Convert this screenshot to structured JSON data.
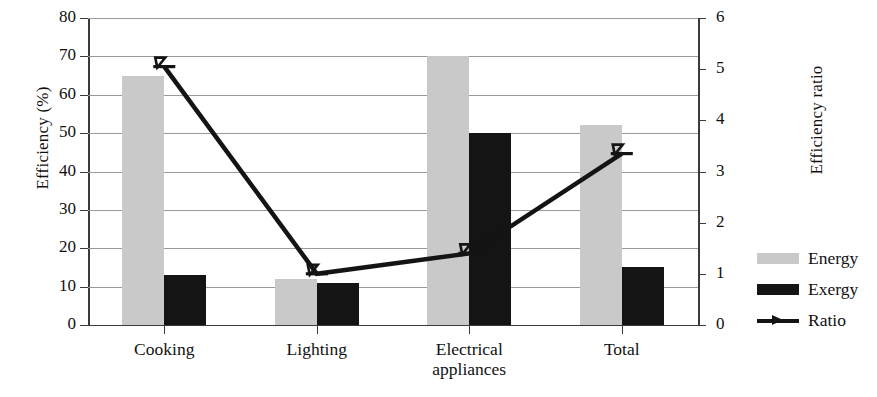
{
  "chart_data": {
    "type": "bar",
    "title": "",
    "subtitle": "",
    "xlabel": "",
    "ylabel": "Efficiency (%)",
    "y2label": "Efficiency ratio",
    "categories": [
      "Cooking",
      "Lighting",
      "Electrical appliances",
      "Total"
    ],
    "category_lines": [
      [
        "Cooking"
      ],
      [
        "Lighting"
      ],
      [
        "Electrical",
        "appliances"
      ],
      [
        "Total"
      ]
    ],
    "series": [
      {
        "name": "Energy",
        "type": "bar",
        "axis": "left",
        "color": "#c9c9c9",
        "values": [
          65,
          12,
          70,
          52
        ]
      },
      {
        "name": "Exergy",
        "type": "bar",
        "axis": "left",
        "color": "#141414",
        "values": [
          13,
          11,
          50,
          15
        ]
      },
      {
        "name": "Ratio",
        "type": "line",
        "axis": "right",
        "color": "#141414",
        "values": [
          5.05,
          1.0,
          1.4,
          3.35
        ]
      }
    ],
    "ylim": [
      0,
      80
    ],
    "yticks": [
      0,
      10,
      20,
      30,
      40,
      50,
      60,
      70,
      80
    ],
    "y2lim": [
      0,
      6
    ],
    "y2ticks": [
      0,
      1,
      2,
      3,
      4,
      5,
      6
    ],
    "grid": true,
    "grid_axis": "y",
    "legend_position": "right",
    "legend": [
      "Energy",
      "Exergy",
      "Ratio"
    ]
  },
  "legend": {
    "items": [
      {
        "label": "Energy",
        "swatch": "energy-swatch"
      },
      {
        "label": "Exergy",
        "swatch": "exergy-swatch"
      },
      {
        "label": "Ratio",
        "swatch": "ratio-line-marker"
      }
    ]
  }
}
